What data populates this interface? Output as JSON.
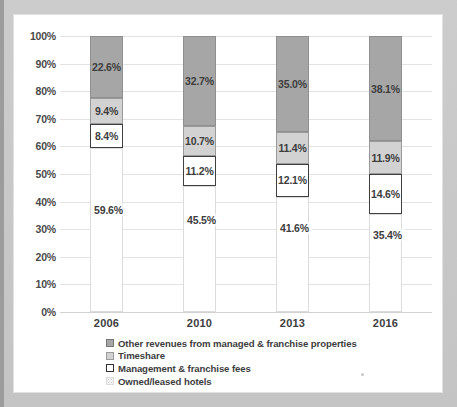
{
  "chart_data": {
    "type": "bar",
    "variant": "stacked-100-percent",
    "title": "",
    "subtitle": "",
    "xlabel": "",
    "ylabel": "",
    "ylim": [
      0,
      100
    ],
    "ytick_labels": [
      "100%",
      "90%",
      "80%",
      "70%",
      "60%",
      "50%",
      "40%",
      "30%",
      "20%",
      "10%",
      "0%"
    ],
    "ytick_values": [
      100,
      90,
      80,
      70,
      60,
      50,
      40,
      30,
      20,
      10,
      0
    ],
    "grid": true,
    "legend_position": "bottom-center",
    "categories": [
      "2006",
      "2010",
      "2013",
      "2016"
    ],
    "series": [
      {
        "name": "Other revenues from managed & franchise properties",
        "color": "#a6a6a6",
        "values": [
          22.6,
          32.7,
          35.0,
          38.1
        ],
        "labels": [
          "22.6%",
          "32.7%",
          "35.0%",
          "38.1%"
        ]
      },
      {
        "name": "Timeshare",
        "color": "#d2d2d2",
        "values": [
          9.4,
          10.7,
          11.4,
          11.9
        ],
        "labels": [
          "9.4%",
          "10.7%",
          "11.4%",
          "11.9%"
        ]
      },
      {
        "name": "Management & franchise fees",
        "color": "#ffffff",
        "values": [
          8.4,
          11.2,
          12.1,
          14.6
        ],
        "labels": [
          "8.4%",
          "11.2%",
          "12.1%",
          "14.6%"
        ]
      },
      {
        "name": "Owned/leased hotels",
        "color": "#ffffff",
        "values": [
          59.6,
          45.5,
          41.6,
          35.4
        ],
        "labels": [
          "59.6%",
          "45.5%",
          "41.6%",
          "35.4%"
        ]
      }
    ]
  },
  "legend": {
    "items": [
      {
        "label": "Other revenues from managed & franchise properties",
        "swatch": "dark-gray-solid"
      },
      {
        "label": "Timeshare",
        "swatch": "light-gray-solid"
      },
      {
        "label": "Management & franchise fees",
        "swatch": "white-black-border"
      },
      {
        "label": "Owned/leased hotels",
        "swatch": "white-dotted"
      }
    ]
  }
}
